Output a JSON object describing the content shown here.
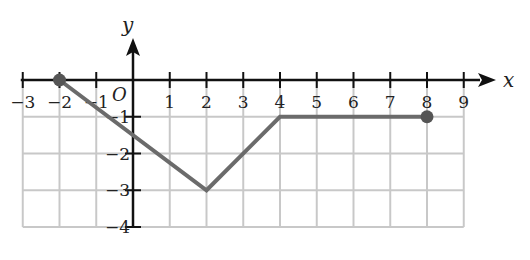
{
  "chart_data": {
    "type": "line",
    "title": "",
    "xlabel": "x",
    "ylabel": "y",
    "origin_label": "O",
    "xlim": [
      -3,
      9
    ],
    "ylim": [
      -4,
      0
    ],
    "x_ticks": [
      -3,
      -2,
      -1,
      1,
      2,
      3,
      4,
      5,
      6,
      7,
      8,
      9
    ],
    "x_tick_labels": [
      "−3",
      "−2",
      "−1",
      "1",
      "2",
      "3",
      "4",
      "5",
      "6",
      "7",
      "8",
      "9"
    ],
    "y_ticks": [
      -1,
      -2,
      -3,
      -4
    ],
    "y_tick_labels": [
      "−1",
      "−2",
      "−3",
      "−4"
    ],
    "grid": true,
    "grid_region": {
      "x": [
        -3,
        9
      ],
      "y": [
        -4,
        -1
      ]
    },
    "series": [
      {
        "name": "piecewise graph",
        "points": [
          [
            -2,
            0
          ],
          [
            2,
            -3
          ],
          [
            4,
            -1
          ],
          [
            8,
            -1
          ]
        ],
        "endpoints": [
          [
            -2,
            0
          ],
          [
            8,
            -1
          ]
        ],
        "endpoint_style": "closed"
      }
    ],
    "colors": {
      "axis": "#111111",
      "grid": "#c8c8c8",
      "line": "#6b6b6b",
      "endpoint": "#555555"
    }
  }
}
